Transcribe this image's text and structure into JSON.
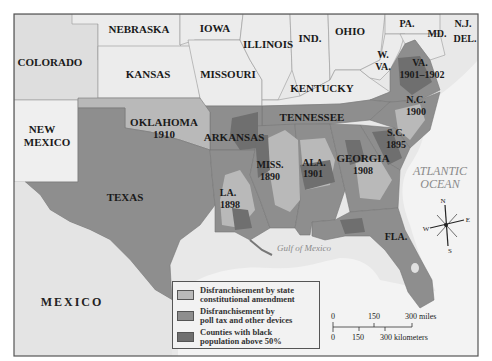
{
  "map": {
    "title": "",
    "colors": {
      "constitutional": "#b9b9b9",
      "poll_tax": "#8e8e8e",
      "black_majority": "#6f6f6f",
      "unaffected_state": "#ececec",
      "terrain": "#e6e6e6",
      "water": "#f4f4f4",
      "frame": "#555555"
    },
    "states": {
      "colorado": "COLORADO",
      "nebraska": "NEBRASKA",
      "iowa": "IOWA",
      "illinois": "ILLINOIS",
      "indiana": "IND.",
      "ohio": "OHIO",
      "pennsylvania": "PA.",
      "new_jersey": "N.J.",
      "maryland": "MD.",
      "delaware": "DEL.",
      "kansas": "KANSAS",
      "missouri": "MISSOURI",
      "west_virginia_1": "W.",
      "west_virginia_2": "VA.",
      "virginia": "VA.",
      "virginia_year": "1901–1902",
      "kentucky": "KENTUCKY",
      "new_mexico_1": "NEW",
      "new_mexico_2": "MEXICO",
      "oklahoma": "OKLAHOMA",
      "oklahoma_year": "1910",
      "arkansas": "ARKANSAS",
      "tennessee": "TENNESSEE",
      "north_carolina": "N.C.",
      "north_carolina_year": "1900",
      "south_carolina": "S.C.",
      "south_carolina_year": "1895",
      "texas": "TEXAS",
      "louisiana": "LA.",
      "louisiana_year": "1898",
      "mississippi": "MISS.",
      "mississippi_year": "1890",
      "alabama": "ALA.",
      "alabama_year": "1901",
      "georgia": "GEORGIA",
      "georgia_year": "1908",
      "florida": "FLA."
    },
    "water_labels": {
      "atlantic_1": "ATLANTIC",
      "atlantic_2": "OCEAN",
      "gulf": "Gulf of Mexico"
    },
    "country_labels": {
      "mexico": "MEXICO"
    },
    "compass": {
      "n": "N",
      "s": "S",
      "e": "E",
      "w": "W"
    },
    "scale": {
      "miles_0": "0",
      "miles_150": "150",
      "miles_300": "300 miles",
      "km_0": "0",
      "km_150": "150",
      "km_300": "300 kilometers"
    },
    "legend": {
      "items": [
        {
          "label_1": "Disfranchisement by state",
          "label_2": "constitutional amendment"
        },
        {
          "label_1": "Disfranchisement by",
          "label_2": "poll tax and other devices"
        },
        {
          "label_1": "Counties with black",
          "label_2": "population above 50%"
        }
      ]
    }
  }
}
